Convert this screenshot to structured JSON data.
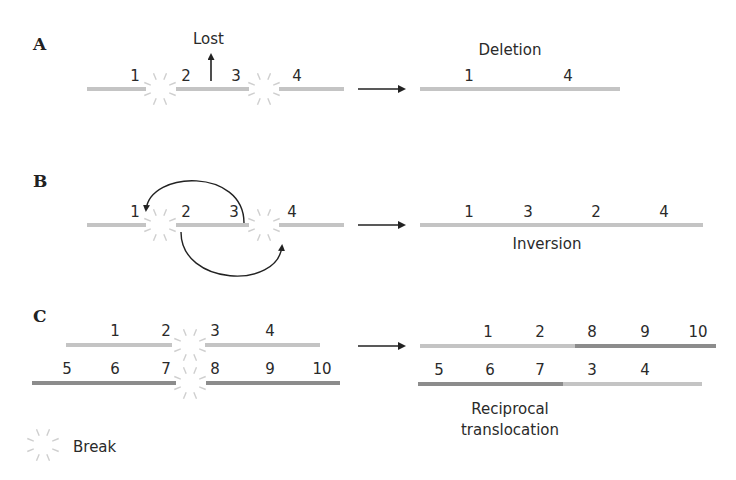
{
  "colors": {
    "light": "#c4c4c4",
    "dark": "#8c8c8c",
    "ray": "#cfcfcf",
    "ink": "#222222"
  },
  "panels": {
    "A": {
      "label": "A",
      "lost_label": "Lost",
      "before": {
        "segments": [
          [
            87,
            146
          ],
          [
            176,
            249
          ],
          [
            279,
            344
          ]
        ],
        "y": 89,
        "breaks": [
          [
            160,
            89
          ],
          [
            264,
            89
          ]
        ],
        "numbers": [
          {
            "t": "1",
            "x": 135
          },
          {
            "t": "2",
            "x": 186
          },
          {
            "t": "3",
            "x": 236
          },
          {
            "t": "4",
            "x": 297
          }
        ]
      },
      "after": {
        "title": "Deletion",
        "segments": [
          [
            420,
            620
          ]
        ],
        "y": 89,
        "numbers": [
          {
            "t": "1",
            "x": 469
          },
          {
            "t": "4",
            "x": 568
          }
        ]
      }
    },
    "B": {
      "label": "B",
      "before": {
        "segments": [
          [
            87,
            146
          ],
          [
            176,
            249
          ],
          [
            279,
            344
          ]
        ],
        "y": 225,
        "breaks": [
          [
            160,
            225
          ],
          [
            264,
            225
          ]
        ],
        "numbers": [
          {
            "t": "1",
            "x": 135
          },
          {
            "t": "2",
            "x": 186
          },
          {
            "t": "3",
            "x": 234
          },
          {
            "t": "4",
            "x": 292
          }
        ]
      },
      "after": {
        "title": "Inversion",
        "segments": [
          [
            420,
            703
          ]
        ],
        "y": 225,
        "numbers": [
          {
            "t": "1",
            "x": 469
          },
          {
            "t": "3",
            "x": 528
          },
          {
            "t": "2",
            "x": 596
          },
          {
            "t": "4",
            "x": 664
          }
        ]
      }
    },
    "C": {
      "label": "C",
      "before": {
        "top": {
          "y": 345,
          "segments": [
            [
              66,
              172
            ],
            [
              205,
              320
            ]
          ],
          "numbers": [
            {
              "t": "1",
              "x": 115
            },
            {
              "t": "2",
              "x": 166
            },
            {
              "t": "3",
              "x": 215
            },
            {
              "t": "4",
              "x": 270
            }
          ]
        },
        "bottom": {
          "y": 383,
          "segments": [
            [
              32,
              176
            ],
            [
              206,
              340
            ]
          ],
          "numbers": [
            {
              "t": "5",
              "x": 67
            },
            {
              "t": "6",
              "x": 115
            },
            {
              "t": "7",
              "x": 166
            },
            {
              "t": "8",
              "x": 215
            },
            {
              "t": "9",
              "x": 270
            },
            {
              "t": "10",
              "x": 322
            }
          ]
        },
        "breaks": [
          [
            190,
            345
          ],
          [
            190,
            383
          ]
        ]
      },
      "after": {
        "title_line1": "Reciprocal",
        "title_line2": "translocation",
        "top": {
          "y": 346,
          "light": [
            420,
            575
          ],
          "dark": [
            575,
            716
          ],
          "numbers": [
            {
              "t": "1",
              "x": 488
            },
            {
              "t": "2",
              "x": 540
            },
            {
              "t": "8",
              "x": 592
            },
            {
              "t": "9",
              "x": 645
            },
            {
              "t": "10",
              "x": 698
            }
          ]
        },
        "bottom": {
          "y": 384,
          "dark": [
            418,
            563
          ],
          "light": [
            563,
            702
          ],
          "numbers": [
            {
              "t": "5",
              "x": 439
            },
            {
              "t": "6",
              "x": 490
            },
            {
              "t": "7",
              "x": 540
            },
            {
              "t": "3",
              "x": 592
            },
            {
              "t": "4",
              "x": 645
            }
          ]
        }
      }
    }
  },
  "legend": {
    "label": "Break"
  }
}
